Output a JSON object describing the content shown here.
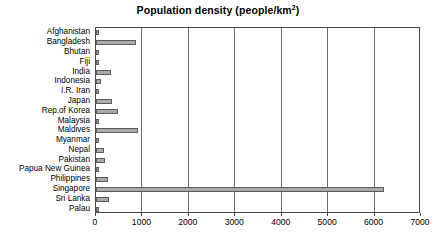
{
  "chart_data": {
    "type": "bar",
    "orientation": "horizontal",
    "title": "Population density (people/km",
    "title_sup": "2",
    "title_suffix": ")",
    "title_full": "Population density (people/km2)",
    "xlabel": "",
    "ylabel": "",
    "xlim": [
      0,
      7000
    ],
    "xticks": [
      0,
      1000,
      2000,
      3000,
      4000,
      5000,
      6000,
      7000
    ],
    "xtick_labels": [
      "0",
      "1000",
      "2000",
      "3000",
      "4000",
      "5000",
      "6000",
      "7000"
    ],
    "grid": true,
    "grid_axis": "x",
    "legend": false,
    "bar_fill_color": "#a9a9a9",
    "bar_edge_color": "#5d5d5d",
    "axis_color": "#4a4a4a",
    "categories": [
      "Afghanistan",
      "Bangladesh",
      "Bhutan",
      "Fiji",
      "India",
      "Indonesia",
      "I.R. Iran",
      "Japan",
      "Rep.of Korea",
      "Malaysia",
      "Maldives",
      "Myanmar",
      "Nepal",
      "Pakistan",
      "Papua New Guinea",
      "Philippines",
      "Singapore",
      "Sri Lanka",
      "Palau"
    ],
    "values": [
      40,
      860,
      45,
      45,
      320,
      115,
      42,
      340,
      470,
      75,
      900,
      72,
      175,
      190,
      12,
      250,
      6200,
      290,
      40
    ]
  }
}
